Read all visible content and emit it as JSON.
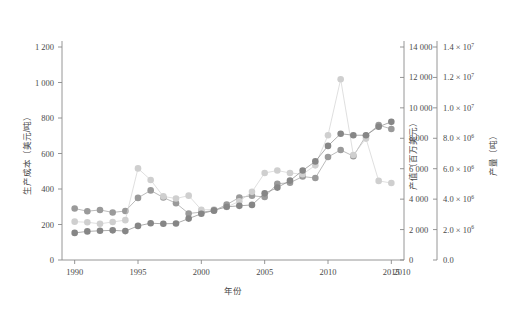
{
  "chart_data": {
    "type": "scatter",
    "title": "",
    "xlabel": "年份",
    "xlim": [
      1989,
      2016
    ],
    "xticks": [
      1990,
      1995,
      2000,
      2005,
      2010,
      2015
    ],
    "xticklabels": [
      "1990",
      "1995",
      "2000",
      "2005",
      "2010",
      "2015"
    ],
    "extra_axis_tick_label": "2010",
    "grid": false,
    "legend": "none",
    "axes": [
      {
        "id": "left",
        "position": "left",
        "label": "生产成本（美元/吨）",
        "lim": [
          0,
          1200
        ],
        "ticks": [
          0,
          200,
          400,
          600,
          800,
          1000,
          1200
        ],
        "ticklabels": [
          "0",
          "200",
          "400",
          "600",
          "800",
          "1 000",
          "1 200"
        ]
      },
      {
        "id": "right1",
        "position": "right",
        "label": "产值（百万美元）",
        "lim": [
          0,
          14000
        ],
        "ticks": [
          0,
          2000,
          4000,
          6000,
          8000,
          10000,
          12000,
          14000
        ],
        "ticklabels": [
          "0",
          "2 000",
          "4 000",
          "6 000",
          "8 000",
          "10 000",
          "12 000",
          "14 000"
        ]
      },
      {
        "id": "right2",
        "position": "right-outer",
        "label": "产量（吨）",
        "lim": [
          0,
          14000000
        ],
        "ticks": [
          0,
          2000000,
          4000000,
          6000000,
          8000000,
          10000000,
          12000000,
          14000000
        ],
        "ticklabels": [
          "0.0",
          "2.0 × 10",
          "4.0 × 10",
          "6.0 × 10",
          "8.0 × 10",
          "1.0 × 10",
          "1.2 × 10",
          "1.4 × 10"
        ],
        "tickexponents": [
          "",
          "6",
          "6",
          "6",
          "6",
          "7",
          "7",
          "7"
        ]
      }
    ],
    "series": [
      {
        "name": "生产成本",
        "axis": "left",
        "color": "#9a9a9a",
        "marker": "circle",
        "x": [
          1990,
          1991,
          1992,
          1993,
          1994,
          1995,
          1996,
          1997,
          1998,
          1999,
          2000,
          2001,
          2002,
          2003,
          2004,
          2005,
          2006,
          2007,
          2008,
          2009,
          2010,
          2011,
          2012,
          2013,
          2014,
          2015
        ],
        "y": [
          290,
          275,
          282,
          268,
          276,
          350,
          392,
          352,
          320,
          262,
          270,
          278,
          312,
          352,
          362,
          355,
          430,
          435,
          470,
          462,
          580,
          620,
          585,
          700,
          760,
          738
        ]
      },
      {
        "name": "产值",
        "axis": "right1",
        "color": "#cfcfcf",
        "marker": "circle",
        "x": [
          1990,
          1991,
          1992,
          1993,
          1994,
          1995,
          1996,
          1997,
          1998,
          1999,
          2000,
          2001,
          2002,
          2003,
          2004,
          2005,
          2006,
          2007,
          2008,
          2009,
          2010,
          2011,
          2012,
          2013,
          2014,
          2015
        ],
        "y": [
          2520,
          2480,
          2380,
          2500,
          2620,
          6020,
          5260,
          4180,
          4040,
          4230,
          3300,
          3320,
          3480,
          3860,
          4480,
          5720,
          5880,
          5720,
          5640,
          6220,
          8200,
          11880,
          6900,
          7980,
          5200,
          5060
        ]
      },
      {
        "name": "产量",
        "axis": "right2",
        "color": "#868686",
        "marker": "circle",
        "x": [
          1990,
          1991,
          1992,
          1993,
          1994,
          1995,
          1996,
          1997,
          1998,
          1999,
          2000,
          2001,
          2002,
          2003,
          2004,
          2005,
          2006,
          2007,
          2008,
          2009,
          2010,
          2011,
          2012,
          2013,
          2014,
          2015
        ],
        "y": [
          1780000,
          1880000,
          1920000,
          1950000,
          1900000,
          2240000,
          2420000,
          2380000,
          2400000,
          2720000,
          3040000,
          3260000,
          3500000,
          3560000,
          3620000,
          4380000,
          4760000,
          5220000,
          5880000,
          6480000,
          7500000,
          8300000,
          8200000,
          8200000,
          8760000,
          9080000
        ]
      }
    ]
  }
}
